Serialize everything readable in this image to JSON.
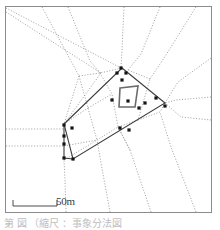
{
  "figure": {
    "type": "site-plan-map",
    "frame": {
      "x": 5,
      "y": 6,
      "width": 207,
      "height": 207,
      "stroke": "#8c8c8c",
      "fill": "#ffffff"
    },
    "background": "#ffffff"
  },
  "scale_bar": {
    "label": "50m",
    "x1": 13,
    "x2": 57,
    "y": 206,
    "tick_height": 6,
    "stroke": "#4a4a4a"
  },
  "caption": {
    "text": "第 図 （縮尺 ：事象分法図",
    "visible": "partially-cropped"
  },
  "colors": {
    "frame": "#8c8c8c",
    "boundary_polygon": "#3d3d3d",
    "inner_structure": "#6b6b6b",
    "network_dotted": "#9b9b9b",
    "point_marker": "#141414",
    "scale": "#4a4a4a",
    "text": "#3a3a3a"
  },
  "map_data": {
    "boundary_polygon": {
      "name": "survey-boundary",
      "stroke": "#3d3d3d",
      "stroke_width": 1.1,
      "points": [
        [
          122,
          68
        ],
        [
          165,
          103
        ],
        [
          73,
          159
        ],
        [
          64,
          124
        ]
      ]
    },
    "inner_structure": {
      "name": "inner-enclosure",
      "stroke": "#6b6b6b",
      "stroke_width": 1.6,
      "points": [
        [
          120,
          88
        ],
        [
          138,
          86
        ],
        [
          135,
          107
        ],
        [
          119,
          107
        ]
      ]
    },
    "left_spur": {
      "name": "west-wall-segment",
      "stroke": "#3d3d3d",
      "points": [
        [
          64,
          124
        ],
        [
          64,
          158
        ],
        [
          73,
          159
        ]
      ]
    },
    "network_lines": [
      {
        "name": "ray-nw-1",
        "points": [
          [
            6,
            8
          ],
          [
            121,
            68
          ]
        ]
      },
      {
        "name": "ray-nw-2",
        "points": [
          [
            6,
            12
          ],
          [
            101,
            73
          ],
          [
            64,
            124
          ]
        ]
      },
      {
        "name": "ray-n-1",
        "points": [
          [
            42,
            7
          ],
          [
            79,
            76
          ],
          [
            64,
            124
          ]
        ]
      },
      {
        "name": "ray-n-2",
        "points": [
          [
            68,
            7
          ],
          [
            90,
            61
          ],
          [
            100,
            73
          ]
        ]
      },
      {
        "name": "ray-ne-1",
        "points": [
          [
            124,
            7
          ],
          [
            122,
            50
          ],
          [
            121,
            68
          ]
        ]
      },
      {
        "name": "ray-ne-2",
        "points": [
          [
            160,
            7
          ],
          [
            141,
            54
          ],
          [
            128,
            70
          ]
        ]
      },
      {
        "name": "ray-ne-3",
        "points": [
          [
            196,
            7
          ],
          [
            166,
            55
          ],
          [
            150,
            79
          ]
        ]
      },
      {
        "name": "ray-e-1",
        "points": [
          [
            211,
            58
          ],
          [
            178,
            82
          ],
          [
            165,
            103
          ]
        ]
      },
      {
        "name": "ray-e-2",
        "points": [
          [
            211,
            97
          ],
          [
            176,
            100
          ],
          [
            165,
            103
          ]
        ]
      },
      {
        "name": "ray-e-3",
        "points": [
          [
            211,
            120
          ],
          [
            181,
            117
          ],
          [
            165,
            103
          ]
        ]
      },
      {
        "name": "ray-se-1",
        "points": [
          [
            196,
            212
          ],
          [
            171,
            147
          ],
          [
            160,
            112
          ]
        ]
      },
      {
        "name": "ray-s-1",
        "points": [
          [
            151,
            212
          ],
          [
            130,
            150
          ],
          [
            118,
            127
          ]
        ]
      },
      {
        "name": "ray-s-2",
        "points": [
          [
            110,
            212
          ],
          [
            101,
            163
          ],
          [
            97,
            140
          ]
        ]
      },
      {
        "name": "ray-s-3",
        "points": [
          [
            66,
            212
          ],
          [
            65,
            180
          ],
          [
            64,
            160
          ]
        ]
      },
      {
        "name": "ray-w-1",
        "points": [
          [
            6,
            129
          ],
          [
            64,
            129
          ]
        ]
      },
      {
        "name": "ray-w-2",
        "points": [
          [
            6,
            146
          ],
          [
            64,
            146
          ]
        ]
      },
      {
        "name": "cell-edge-1",
        "points": [
          [
            79,
            76
          ],
          [
            100,
            73
          ],
          [
            122,
            68
          ]
        ]
      },
      {
        "name": "cell-edge-2",
        "points": [
          [
            100,
            73
          ],
          [
            112,
            94
          ],
          [
            118,
            127
          ]
        ]
      },
      {
        "name": "cell-edge-3",
        "points": [
          [
            79,
            76
          ],
          [
            88,
            108
          ],
          [
            97,
            140
          ]
        ]
      },
      {
        "name": "cell-edge-4",
        "points": [
          [
            88,
            108
          ],
          [
            112,
            94
          ]
        ]
      },
      {
        "name": "cell-edge-5",
        "points": [
          [
            97,
            140
          ],
          [
            118,
            127
          ],
          [
            138,
            120
          ],
          [
            150,
            79
          ]
        ]
      },
      {
        "name": "cell-edge-6",
        "points": [
          [
            118,
            127
          ],
          [
            130,
            150
          ]
        ]
      },
      {
        "name": "cell-edge-7",
        "points": [
          [
            138,
            120
          ],
          [
            160,
            112
          ],
          [
            165,
            103
          ]
        ]
      },
      {
        "name": "cell-edge-8",
        "points": [
          [
            64,
            124
          ],
          [
            88,
            108
          ]
        ]
      },
      {
        "name": "cell-edge-9",
        "points": [
          [
            64,
            146
          ],
          [
            97,
            140
          ]
        ]
      },
      {
        "name": "cell-edge-10",
        "points": [
          [
            150,
            79
          ],
          [
            128,
            70
          ]
        ]
      },
      {
        "name": "cell-edge-11",
        "points": [
          [
            64,
            160
          ],
          [
            97,
            140
          ]
        ]
      }
    ],
    "point_markers": [
      {
        "name": "site-point",
        "x": 121,
        "y": 68
      },
      {
        "name": "site-point",
        "x": 117,
        "y": 73
      },
      {
        "name": "site-point",
        "x": 126,
        "y": 73
      },
      {
        "name": "site-point",
        "x": 122,
        "y": 80
      },
      {
        "name": "site-point",
        "x": 112,
        "y": 100
      },
      {
        "name": "site-point",
        "x": 128,
        "y": 101
      },
      {
        "name": "site-point",
        "x": 145,
        "y": 103
      },
      {
        "name": "site-point",
        "x": 156,
        "y": 98
      },
      {
        "name": "site-point",
        "x": 165,
        "y": 106
      },
      {
        "name": "site-point",
        "x": 139,
        "y": 108
      },
      {
        "name": "site-point",
        "x": 120,
        "y": 128
      },
      {
        "name": "site-point",
        "x": 129,
        "y": 130
      },
      {
        "name": "site-point",
        "x": 64,
        "y": 125
      },
      {
        "name": "site-point",
        "x": 72,
        "y": 128
      },
      {
        "name": "site-point",
        "x": 64,
        "y": 136
      },
      {
        "name": "site-point",
        "x": 64,
        "y": 144
      },
      {
        "name": "site-point",
        "x": 64,
        "y": 158
      },
      {
        "name": "site-point",
        "x": 73,
        "y": 159
      }
    ],
    "marker_style": {
      "shape": "square",
      "size": 3.2,
      "fill": "#141414"
    }
  }
}
